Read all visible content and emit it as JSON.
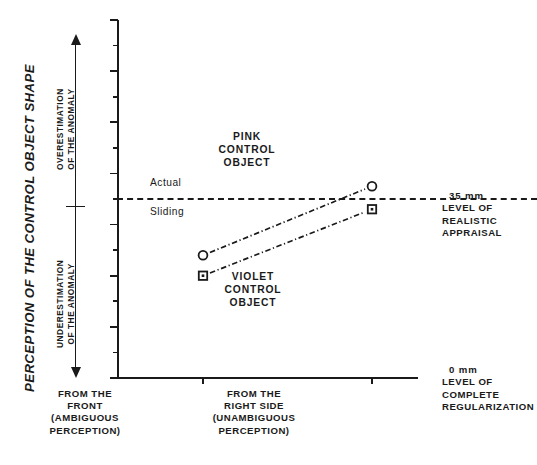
{
  "axis_title": "PERCEPTION OF THE CONTROL OBJECT SHAPE",
  "direction": {
    "over_line1": "OVERESTIMATION",
    "over_line2": "OF THE ANOMALY",
    "under_line1": "UNDERESTIMATION",
    "under_line2": "OF THE ANOMALY",
    "up_arrow_icon": "arrow-up-icon",
    "down_arrow_icon": "arrow-down-icon"
  },
  "reference_line": {
    "value": 35,
    "label_above": "Actual",
    "label_below": "Sliding"
  },
  "series_labels": {
    "pink": [
      "PINK",
      "CONTROL",
      "OBJECT"
    ],
    "violet": [
      "VIOLET",
      "CONTROL",
      "OBJECT"
    ]
  },
  "side_notes": {
    "top": {
      "amount": "35 mm",
      "lines": [
        "LEVEL OF",
        "REALISTIC",
        "APPRAISAL"
      ]
    },
    "bottom": {
      "amount": "0 mm",
      "lines": [
        "LEVEL OF",
        "COMPLETE",
        "REGULARIZATION"
      ]
    }
  },
  "chart_data": {
    "type": "line",
    "title": "PERCEPTION OF THE CONTROL OBJECT SHAPE",
    "xlabel": "",
    "ylabel": "PERCEPTION OF THE CONTROL OBJECT SHAPE",
    "ylim": [
      0,
      70
    ],
    "yticks": [
      0,
      10,
      20,
      30,
      40,
      50,
      60,
      70
    ],
    "ytick_labels": [
      "0",
      "10",
      "20",
      "30",
      "40",
      "50",
      "60",
      "70"
    ],
    "yminor_ticks": [
      5,
      15,
      25,
      35,
      45,
      55,
      65
    ],
    "grid": false,
    "legend": "none",
    "categories": [
      "FROM THE FRONT (AMBIGUOUS PERCEPTION)",
      "FROM THE RIGHT SIDE (UNAMBIGUOUS PERCEPTION)"
    ],
    "category_lines": [
      [
        "FROM THE",
        "FRONT",
        "(AMBIGUOUS",
        "PERCEPTION)"
      ],
      [
        "FROM THE",
        "RIGHT SIDE",
        "(UNAMBIGUOUS",
        "PERCEPTION)"
      ]
    ],
    "series": [
      {
        "name": "PINK CONTROL OBJECT",
        "marker": "circle",
        "linestyle": "dashdot",
        "values": [
          24,
          37.5
        ]
      },
      {
        "name": "VIOLET CONTROL OBJECT",
        "marker": "square",
        "linestyle": "dashdot",
        "values": [
          20,
          33
        ]
      }
    ],
    "annotations": [
      {
        "type": "hline",
        "y": 35,
        "style": "dashed",
        "label": "35 mm LEVEL OF REALISTIC APPRAISAL"
      },
      {
        "type": "text",
        "y": 35,
        "label": "Actual",
        "position": "above-line"
      },
      {
        "type": "text",
        "y": 35,
        "label": "Sliding",
        "position": "below-line"
      },
      {
        "type": "text",
        "label": "0 mm LEVEL OF COMPLETE REGULARIZATION",
        "y": 0
      }
    ],
    "colors": {
      "ink": "#1a1a1a",
      "background": "#ffffff"
    }
  }
}
